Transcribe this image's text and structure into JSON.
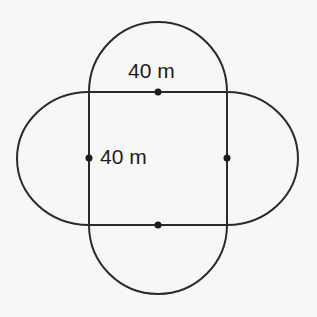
{
  "diagram": {
    "square_side_label": "40 m",
    "top_label": "40 m",
    "side_label": "40 m",
    "stroke_color": "#2a2a2a",
    "background_color": "#f7f7f5",
    "points": [
      "top-midpoint",
      "bottom-midpoint",
      "left-midpoint",
      "right-midpoint"
    ]
  }
}
